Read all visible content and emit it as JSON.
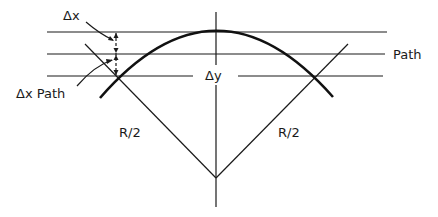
{
  "diagram": {
    "labels": {
      "delta_x": "Δx",
      "delta_x_path": "Δx Path",
      "path": "Path",
      "delta_y": "Δy",
      "radius_left": "R/2",
      "radius_right": "R/2"
    },
    "colors": {
      "ink": "#1a1a1a",
      "background": "#ffffff"
    }
  }
}
